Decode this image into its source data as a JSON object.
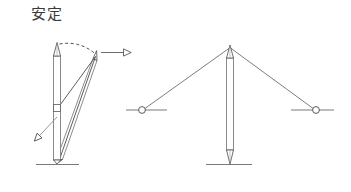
{
  "figure": {
    "title": "安定",
    "background_color": "#ffffff",
    "stroke_color": "#5a5a5a",
    "stroke_color_light": "#8a8a8a",
    "stroke_color_dark": "#3a3a3a",
    "fill_color": "#ffffff",
    "panels": [
      {
        "name": "unstable-pole-panel",
        "description": "Pencil standing on ground tipping over, with motion arc and force arrows",
        "elements": [
          {
            "name": "ground-line",
            "type": "line",
            "x1": 36,
            "y1": 161,
            "x2": 80,
            "y2": 161
          },
          {
            "name": "upright-pencil",
            "type": "pencil",
            "tip_x": 57,
            "tip_y": 43,
            "base_x": 57,
            "base_y": 160,
            "width": 7,
            "band_y": 108
          },
          {
            "name": "tilted-pencil",
            "type": "pencil",
            "tip_x": 97,
            "tip_y": 56,
            "base_x": 59,
            "base_y": 160,
            "width": 7
          },
          {
            "name": "rotation-arc",
            "type": "dashed-arc",
            "from_x": 58,
            "from_y": 45,
            "to_x": 95,
            "to_y": 54
          },
          {
            "name": "tip-force-arrow",
            "type": "arrow",
            "x1": 101,
            "y1": 53,
            "x2": 132,
            "y2": 53,
            "direction": "right"
          },
          {
            "name": "gravity-arrow",
            "type": "arrow",
            "x1": 58,
            "y1": 117,
            "x2": 33,
            "y2": 143,
            "direction": "down-left"
          },
          {
            "name": "pivot-line-upper",
            "type": "line",
            "x1": 57,
            "y1": 108,
            "x2": 96,
            "y2": 57
          },
          {
            "name": "pivot-line-lower",
            "type": "line",
            "x1": 60,
            "y1": 158,
            "x2": 96,
            "y2": 57
          }
        ]
      },
      {
        "name": "stable-guyed-pole-panel",
        "description": "Vertical pencil mast braced by two guy wires anchored to ground points",
        "elements": [
          {
            "name": "mast-pencil",
            "type": "pencil",
            "tip_x": 230,
            "tip_y": 46,
            "base_x": 230,
            "base_y": 162,
            "width": 7
          },
          {
            "name": "mast-ground-line",
            "type": "line",
            "x1": 207,
            "y1": 164,
            "x2": 252,
            "y2": 164
          },
          {
            "name": "left-guy-wire",
            "type": "line",
            "x1": 230,
            "y1": 48,
            "x2": 143,
            "y2": 110
          },
          {
            "name": "right-guy-wire",
            "type": "line",
            "x1": 230,
            "y1": 48,
            "x2": 315,
            "y2": 110
          },
          {
            "name": "left-anchor-circle",
            "type": "circle",
            "cx": 142,
            "cy": 110,
            "r": 3.5
          },
          {
            "name": "right-anchor-circle",
            "type": "circle",
            "cx": 316,
            "cy": 110,
            "r": 3.5
          },
          {
            "name": "left-anchor-ground-line",
            "type": "line",
            "x1": 126,
            "y1": 110,
            "x2": 168,
            "y2": 110
          },
          {
            "name": "right-anchor-ground-line",
            "type": "line",
            "x1": 291,
            "y1": 110,
            "x2": 334,
            "y2": 110
          }
        ]
      }
    ]
  }
}
